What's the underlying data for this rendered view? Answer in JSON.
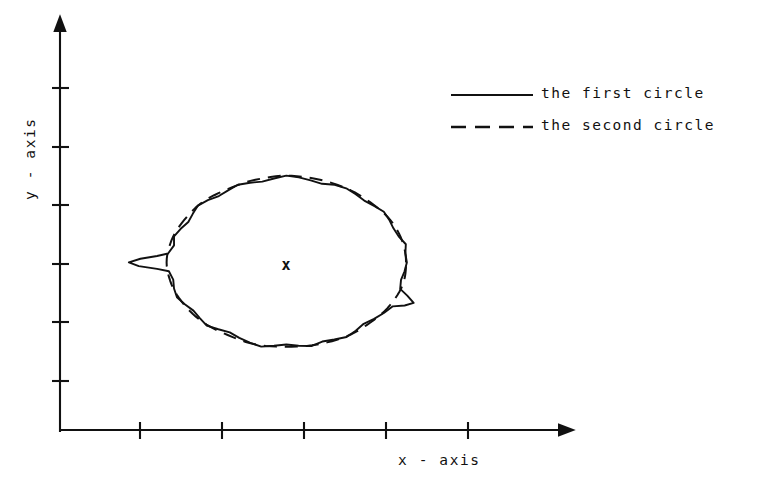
{
  "figure": {
    "background": "#ffffff",
    "ink_color": "#111111"
  },
  "axes": {
    "x_label": "x - axis",
    "y_label": "y - axis",
    "x_tick_count": 5,
    "y_tick_count": 6,
    "origin_px": [
      60,
      430
    ]
  },
  "legend": {
    "entries": [
      {
        "label": "the first circle",
        "style": "solid"
      },
      {
        "label": "the second circle",
        "style": "dashed"
      }
    ]
  },
  "center_marker": {
    "glyph": "x",
    "x_px": 286,
    "y_px": 264
  },
  "chart_data": {
    "type": "line",
    "title": "",
    "xlabel": "x - axis",
    "ylabel": "y - axis",
    "grid": false,
    "legend_position": "top-right",
    "axis_style": "arrow-axes-with-ticks",
    "xlim": [
      0,
      6.2
    ],
    "ylim": [
      0,
      6.9
    ],
    "x_ticks": [
      1,
      2,
      3,
      4,
      5
    ],
    "y_ticks": [
      1,
      2,
      3,
      4,
      5,
      6
    ],
    "x_tick_labels": [
      "",
      "",
      "",
      "",
      ""
    ],
    "y_tick_labels": [
      "",
      "",
      "",
      "",
      "",
      ""
    ],
    "center": {
      "x": 2.76,
      "y": 2.86
    },
    "series": [
      {
        "name": "the first circle",
        "style": "solid",
        "closed": true,
        "mean_radius": 1.46,
        "description": "noisy hand-traced closed contour, radius varies with measurement noise; includes a leftward spike artifact near 180 degrees and an outward notch near 335 degrees",
        "theta_deg": [
          0,
          6,
          12,
          18,
          24,
          30,
          36,
          42,
          48,
          54,
          60,
          66,
          72,
          78,
          84,
          90,
          96,
          102,
          108,
          114,
          120,
          126,
          132,
          138,
          144,
          150,
          156,
          162,
          168,
          174,
          176,
          178,
          180,
          182,
          184,
          186,
          192,
          198,
          204,
          210,
          216,
          222,
          228,
          234,
          240,
          246,
          252,
          258,
          264,
          270,
          276,
          282,
          288,
          294,
          300,
          306,
          312,
          318,
          324,
          330,
          333,
          336,
          339,
          342,
          348,
          354
        ],
        "radius": [
          1.47,
          1.46,
          1.49,
          1.44,
          1.43,
          1.45,
          1.47,
          1.44,
          1.42,
          1.44,
          1.46,
          1.45,
          1.41,
          1.43,
          1.46,
          1.48,
          1.44,
          1.41,
          1.43,
          1.45,
          1.42,
          1.4,
          1.43,
          1.45,
          1.41,
          1.38,
          1.41,
          1.44,
          1.4,
          1.45,
          1.58,
          1.78,
          1.92,
          1.8,
          1.58,
          1.44,
          1.41,
          1.44,
          1.46,
          1.43,
          1.4,
          1.42,
          1.45,
          1.41,
          1.38,
          1.41,
          1.44,
          1.47,
          1.43,
          1.4,
          1.43,
          1.46,
          1.42,
          1.44,
          1.47,
          1.44,
          1.41,
          1.44,
          1.47,
          1.5,
          1.62,
          1.7,
          1.58,
          1.46,
          1.43,
          1.45
        ]
      },
      {
        "name": "the second circle",
        "style": "dashed",
        "closed": true,
        "mean_radius": 1.46,
        "description": "smooth reference circle drawn as a dashed curve, nearly coincident with the first circle",
        "theta_deg": [
          0,
          15,
          30,
          45,
          60,
          75,
          90,
          105,
          120,
          135,
          150,
          165,
          180,
          195,
          210,
          225,
          240,
          255,
          270,
          285,
          300,
          315,
          330,
          345
        ],
        "radius": [
          1.46,
          1.46,
          1.46,
          1.45,
          1.46,
          1.47,
          1.48,
          1.46,
          1.44,
          1.45,
          1.44,
          1.45,
          1.46,
          1.45,
          1.44,
          1.44,
          1.43,
          1.45,
          1.44,
          1.45,
          1.46,
          1.45,
          1.46,
          1.47
        ]
      }
    ]
  }
}
